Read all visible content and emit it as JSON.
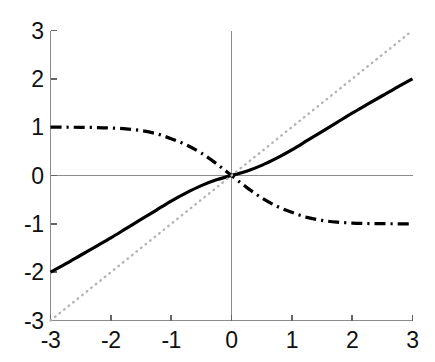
{
  "chart_data": {
    "type": "line",
    "title": "",
    "subtitle": "",
    "xlabel": "",
    "ylabel": "",
    "xlim": [
      -3,
      3
    ],
    "ylim": [
      -3,
      3
    ],
    "xticks": [
      -3,
      -2,
      -1,
      0,
      1,
      2,
      3
    ],
    "yticks": [
      -3,
      -2,
      -1,
      0,
      1,
      2,
      3
    ],
    "xticklabels": [
      "-3",
      "-2",
      "-1",
      "0",
      "1",
      "2",
      "3"
    ],
    "yticklabels": [
      "-3",
      "-2",
      "-1",
      "0",
      "1",
      "2",
      "3"
    ],
    "grid": false,
    "legend": null,
    "legend_position": "none",
    "axis_zero_lines": true,
    "series": [
      {
        "name": "solid-curve",
        "style": "solid",
        "color": "#000000",
        "width": 3.2,
        "x": [
          -3,
          -2.75,
          -2.5,
          -2.25,
          -2,
          -1.75,
          -1.5,
          -1.25,
          -1,
          -0.75,
          -0.5,
          -0.25,
          0,
          0.25,
          0.5,
          0.75,
          1,
          1.25,
          1.5,
          1.75,
          2,
          2.25,
          2.5,
          2.75,
          3
        ],
        "values": [
          -2,
          -1.83,
          -1.65,
          -1.47,
          -1.29,
          -1.1,
          -0.91,
          -0.72,
          -0.53,
          -0.36,
          -0.21,
          -0.09,
          0,
          0.09,
          0.21,
          0.36,
          0.53,
          0.72,
          0.91,
          1.1,
          1.29,
          1.47,
          1.65,
          1.83,
          2
        ]
      },
      {
        "name": "dash-dot-curve",
        "style": "dashdot",
        "color": "#000000",
        "width": 3.2,
        "x": [
          -3,
          -2.75,
          -2.5,
          -2.25,
          -2,
          -1.75,
          -1.5,
          -1.25,
          -1,
          -0.75,
          -0.5,
          -0.25,
          0,
          0.25,
          0.5,
          0.75,
          1,
          1.25,
          1.5,
          1.75,
          2,
          2.25,
          2.5,
          2.75,
          3
        ],
        "values": [
          1,
          0.999,
          0.997,
          0.993,
          0.984,
          0.965,
          0.93,
          0.866,
          0.762,
          0.635,
          0.462,
          0.245,
          0,
          -0.245,
          -0.462,
          -0.635,
          -0.762,
          -0.866,
          -0.93,
          -0.965,
          -0.984,
          -0.993,
          -0.997,
          -0.999,
          -1
        ]
      },
      {
        "name": "dotted-identity-line",
        "style": "dotted",
        "color": "#b4b4b4",
        "width": 2.4,
        "x": [
          -3,
          3
        ],
        "values": [
          -3,
          3
        ]
      }
    ]
  },
  "axes": {
    "frame_color": "#8c8c8c",
    "zero_line_color": "#8c8c8c",
    "tick_color": "#666666",
    "label_color": "#111111"
  }
}
